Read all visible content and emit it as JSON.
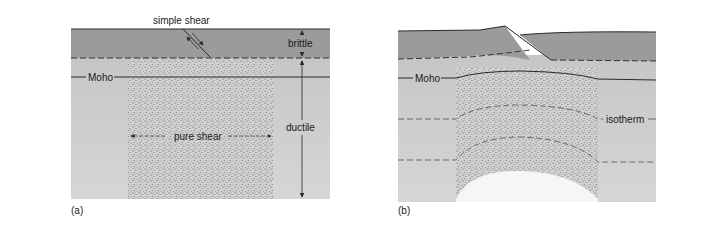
{
  "panel_a": {
    "label": "(a)",
    "simple_shear_label": "simple shear",
    "brittle_label": "brittle",
    "ductile_label": "ductile",
    "moho_label": "Moho",
    "pure_shear_label": "pure shear"
  },
  "panel_b": {
    "label": "(b)",
    "moho_label": "Moho",
    "isotherm_label": "isotherm"
  },
  "colors": {
    "upper_crust": "#9b9b9b",
    "lower_crust": "#c6c6c6",
    "lower_bottom": "#d4d4d4",
    "line": "#2a2a2a",
    "dash": "#444444",
    "isotherm_dash": "#6a6a6a",
    "stipple_dot": "#555555"
  }
}
